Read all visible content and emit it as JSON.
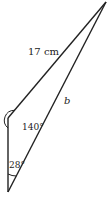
{
  "diagram": {
    "type": "triangle",
    "stroke_color": "#222222",
    "vertices": {
      "top": [
        106,
        2
      ],
      "left": [
        8,
        118
      ],
      "bottom": [
        8,
        192
      ]
    },
    "labels": {
      "side_top_left": "17 cm",
      "side_top_bottom": "b",
      "angle_left": "140°",
      "angle_bottom": "28°"
    }
  }
}
